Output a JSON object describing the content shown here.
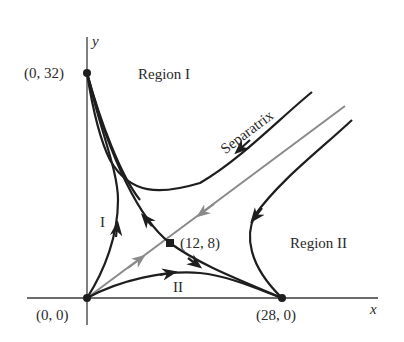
{
  "diagram": {
    "type": "phase-plane",
    "axes": {
      "x_label": "x",
      "y_label": "y"
    },
    "points": [
      {
        "label": "(0, 0)",
        "x": 0,
        "y": 0
      },
      {
        "label": "(0, 32)",
        "x": 0,
        "y": 32
      },
      {
        "label": "(12, 8)",
        "x": 12,
        "y": 8
      },
      {
        "label": "(28, 0)",
        "x": 28,
        "y": 0
      }
    ],
    "regions": {
      "region_1": "Region I",
      "region_2": "Region II"
    },
    "sublabels": {
      "I": "I",
      "II": "II"
    },
    "separatrix_label": "Separatrix",
    "colors": {
      "trajectory": "#1e1e1e",
      "separatrix": "#8a8a8a",
      "axis": "#3a3a3a"
    }
  }
}
